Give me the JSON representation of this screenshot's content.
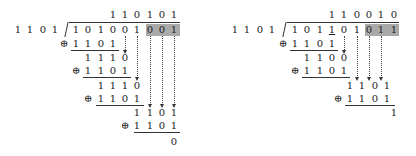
{
  "left": {
    "divisor": [
      "1",
      "1",
      "0",
      "1"
    ],
    "quotient": [
      "1",
      "1",
      "0",
      "1",
      "0",
      "1"
    ],
    "dividend": [
      "1",
      "0",
      "1",
      "0",
      "0",
      "1",
      "0",
      "0",
      "1"
    ],
    "shaded_digits": [
      "0",
      "0",
      "1"
    ],
    "steps": [
      {
        "xor": "⊕",
        "subtrahend": [
          "1",
          "1",
          "0",
          "1"
        ],
        "result": [
          "1",
          "1",
          "1",
          "0"
        ]
      },
      {
        "xor": "⊕",
        "subtrahend": [
          "1",
          "1",
          "0",
          "1"
        ],
        "result": [
          "1",
          "1",
          "1",
          "0"
        ]
      },
      {
        "xor": "⊕",
        "subtrahend": [
          "1",
          "1",
          "0",
          "1"
        ],
        "result": [
          "1",
          "1",
          "0",
          "1"
        ]
      },
      {
        "xor": "⊕",
        "subtrahend": [
          "1",
          "1",
          "0",
          "1"
        ],
        "result": [
          "0"
        ]
      }
    ],
    "remainder": "0"
  },
  "right": {
    "divisor": [
      "1",
      "1",
      "0",
      "1"
    ],
    "quotient": [
      "1",
      "1",
      "0",
      "0",
      "1",
      "0"
    ],
    "dividend": [
      "1",
      "0",
      "1",
      "1",
      "0",
      "1",
      "0",
      "1",
      "1"
    ],
    "shaded_digits": [
      "0",
      "1",
      "1"
    ],
    "steps": [
      {
        "xor": "⊕",
        "subtrahend": [
          "1",
          "1",
          "0",
          "1"
        ],
        "result": [
          "1",
          "1",
          "0",
          "0"
        ]
      },
      {
        "xor": "⊕",
        "subtrahend": [
          "1",
          "1",
          "0",
          "1"
        ],
        "result": [
          "1",
          "1",
          "0",
          "1"
        ]
      },
      {
        "xor": "⊕",
        "subtrahend": [
          "1",
          "1",
          "0",
          "1"
        ],
        "result": [
          "1"
        ]
      }
    ],
    "remainder": "1"
  },
  "colors": {
    "shade": "#a9a9a9",
    "ink": "#222222"
  }
}
